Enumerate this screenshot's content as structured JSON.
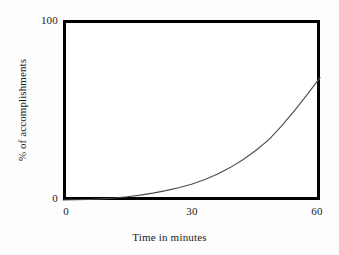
{
  "chart_data": {
    "type": "line",
    "title": "",
    "subtitle": "",
    "xlabel": "Time in minutes",
    "ylabel": "% of accomplishments",
    "xlim": [
      0,
      60
    ],
    "ylim": [
      0,
      100
    ],
    "xticks": [
      "0",
      "30",
      "60"
    ],
    "xtick_values": [
      0,
      30,
      60
    ],
    "yticks": [
      "100",
      "0"
    ],
    "ytick_values": [
      100,
      0
    ],
    "grid": false,
    "legend": null,
    "annotations": [],
    "series": [
      {
        "name": "% of accomplishments",
        "color": "#4a4a4a",
        "line_width": 1,
        "x": [
          0,
          3,
          6,
          9,
          12,
          15,
          18,
          21,
          24,
          27,
          30,
          33,
          36,
          39,
          42,
          45,
          48,
          51,
          54,
          57,
          60
        ],
        "values": [
          0,
          0.1,
          0.3,
          0.6,
          1.1,
          1.8,
          2.7,
          3.8,
          5.2,
          6.8,
          8.7,
          11.2,
          14.3,
          18.0,
          22.4,
          27.5,
          33.4,
          41.0,
          49.5,
          58.5,
          68.0
        ]
      }
    ]
  },
  "axes": {
    "frame_color": "#000000",
    "background": "#ffffff",
    "y_tick_top": "100",
    "y_tick_bottom": "0",
    "x_tick_0": "0",
    "x_tick_30": "30",
    "x_tick_60": "60",
    "y_title": "% of accomplishments",
    "x_title": "Time in minutes"
  }
}
